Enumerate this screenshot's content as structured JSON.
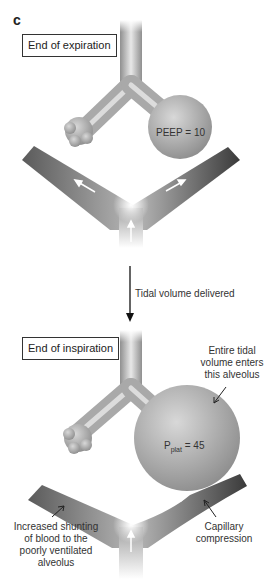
{
  "panel_letter": "c",
  "top": {
    "state_label": "End of expiration",
    "alveolus_label": "PEEP = 10"
  },
  "transition": {
    "label": "Tidal volume delivered"
  },
  "bottom": {
    "state_label": "End of inspiration",
    "alveolus_label_main": "P",
    "alveolus_label_sub": "plat",
    "alveolus_label_value": " = 45",
    "annotation_alveolus": [
      "Entire tidal",
      "volume enters",
      "this alveolus"
    ],
    "annotation_shunt": [
      "Increased shunting",
      "of blood to the",
      "poorly ventilated",
      "alveolus"
    ],
    "annotation_capillary": [
      "Capillary",
      "compression"
    ]
  }
}
